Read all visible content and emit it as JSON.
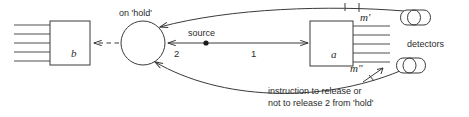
{
  "diagram": {
    "stroke_color": "#3a3a3a",
    "text_color": "#2b2b2b",
    "background": "#ffffff",
    "labels": {
      "on_hold": "on 'hold'",
      "source": "source",
      "box_b": "b",
      "box_a": "a",
      "path_two": "2",
      "path_one": "1",
      "m_prime": "m'",
      "m_double_prime": "m″",
      "detectors": "detectors",
      "instruction_line1": "instruction to release or",
      "instruction_line2": "not to release 2 from 'hold'"
    },
    "nodes": [
      {
        "name": "box-b",
        "label": "b",
        "shape": "rectangle",
        "beam_lines": 5,
        "beam_side": "left"
      },
      {
        "name": "hold-circle",
        "label": "on 'hold'",
        "shape": "circle"
      },
      {
        "name": "source-point",
        "label": "source",
        "shape": "dot"
      },
      {
        "name": "box-a",
        "label": "a",
        "shape": "rectangle",
        "beam_lines": 5,
        "beam_side": "right"
      },
      {
        "name": "detector-upper",
        "label": "detectors",
        "shape": "cylinder"
      },
      {
        "name": "detector-lower",
        "label": "detectors",
        "shape": "cylinder"
      }
    ],
    "edges": [
      {
        "name": "edge-b-from-hold",
        "from": "hold-circle",
        "to": "box-b",
        "style": "dashed",
        "arrow": "to"
      },
      {
        "name": "edge-source-to-hold",
        "from": "source-point",
        "to": "hold-circle",
        "style": "solid",
        "arrow": "to",
        "label": "2"
      },
      {
        "name": "edge-source-to-a",
        "from": "source-point",
        "to": "box-a",
        "style": "solid",
        "arrow": "to",
        "label": "1"
      },
      {
        "name": "edge-upper-detector-to-hold",
        "from": "detector-upper",
        "to": "hold-circle",
        "style": "curve",
        "arrow": "to",
        "label": "m'"
      },
      {
        "name": "edge-lower-detector-to-hold",
        "from": "detector-lower",
        "to": "hold-circle",
        "style": "curve",
        "arrow": "to",
        "label": "m″"
      }
    ]
  }
}
